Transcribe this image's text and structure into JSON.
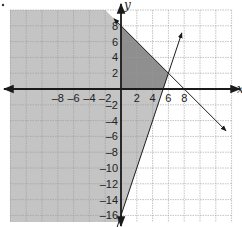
{
  "chart_data": {
    "type": "inequality-graph",
    "title": "",
    "xlabel": "x",
    "ylabel": "y",
    "xlim": [
      -14,
      14
    ],
    "ylim": [
      -17,
      10
    ],
    "grid": true,
    "grid_step": 2,
    "x_ticks": [
      "-8",
      "-6",
      "-4",
      "-2",
      "2",
      "4",
      "6",
      "8"
    ],
    "y_ticks": [
      "8",
      "6",
      "4",
      "2",
      "-2",
      "-4",
      "-6",
      "-8",
      "-10",
      "-12",
      "-14",
      "-16"
    ],
    "lines": [
      {
        "name": "boundary-1",
        "equation": "y = -x + 8",
        "points": [
          [
            0,
            8
          ],
          [
            8,
            0
          ]
        ]
      },
      {
        "name": "boundary-2",
        "equation": "y = 3x - 16",
        "points": [
          [
            6,
            2
          ],
          [
            0,
            -16
          ]
        ]
      }
    ],
    "regions": [
      {
        "name": "light-shaded",
        "description": "below y=-x+8 and left of y=3x-16",
        "color": "#c4c4c4"
      },
      {
        "name": "dark-shaded-feasible",
        "vertices": [
          [
            0,
            0
          ],
          [
            0,
            8
          ],
          [
            6,
            2
          ],
          [
            5.33,
            0
          ]
        ],
        "color": "#8f8f8f"
      }
    ],
    "intersection": [
      6,
      2
    ]
  },
  "colors": {
    "light": "#c4c4c4",
    "dark": "#8f8f8f",
    "grid": "#9a9a9a",
    "axis": "#1a1a1a"
  }
}
